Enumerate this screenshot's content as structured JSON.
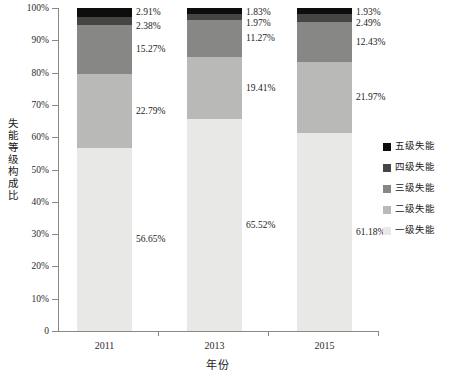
{
  "chart_data": {
    "type": "bar",
    "stacked": true,
    "normalized_percent": true,
    "title": "",
    "xlabel": "年份",
    "ylabel": "失能等级构成比",
    "categories": [
      "2011",
      "2013",
      "2015"
    ],
    "ylim": [
      0,
      100
    ],
    "grid": false,
    "legend_position": "right",
    "y_tick_labels": [
      "100%",
      "90%",
      "80%",
      "70%",
      "60%",
      "50%",
      "40%",
      "30%",
      "20%",
      "10%",
      "0"
    ],
    "y_tick_values": [
      100,
      90,
      80,
      70,
      60,
      50,
      40,
      30,
      20,
      10,
      0
    ],
    "series": [
      {
        "name": "一级失能",
        "color": "#e8e8e6",
        "values": [
          56.65,
          65.52,
          61.18
        ],
        "labels": [
          "56.65%",
          "65.52%",
          "61.18%"
        ]
      },
      {
        "name": "二级失能",
        "color": "#b9b9b7",
        "values": [
          22.79,
          19.41,
          21.97
        ],
        "labels": [
          "22.79%",
          "19.41%",
          "21.97%"
        ]
      },
      {
        "name": "三级失能",
        "color": "#878786",
        "values": [
          15.27,
          11.27,
          12.43
        ],
        "labels": [
          "15.27%",
          "11.27%",
          "12.43%"
        ]
      },
      {
        "name": "四级失能",
        "color": "#454544",
        "values": [
          2.38,
          1.97,
          2.49
        ],
        "labels": [
          "2.38%",
          "1.97%",
          "2.49%"
        ]
      },
      {
        "name": "五级失能",
        "color": "#0d0d0d",
        "values": [
          2.91,
          1.83,
          1.93
        ],
        "labels": [
          "2.91%",
          "1.83%",
          "1.93%"
        ]
      }
    ],
    "legend_entries": [
      {
        "label": "五级失能",
        "color": "#0d0d0d"
      },
      {
        "label": "四级失能",
        "color": "#454544"
      },
      {
        "label": "三级失能",
        "color": "#878786"
      },
      {
        "label": "二级失能",
        "color": "#b9b9b7"
      },
      {
        "label": "一级失能",
        "color": "#e8e8e6"
      }
    ]
  }
}
